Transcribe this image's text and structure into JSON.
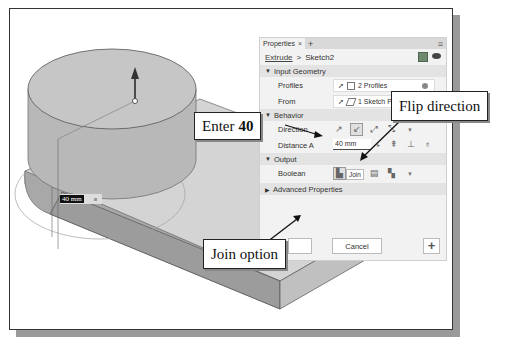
{
  "viewport": {
    "dimension_input": "40 mm"
  },
  "panel": {
    "tab_label": "Properties",
    "tab_close": "×",
    "tab_add": "+",
    "menu_icon": "≡",
    "breadcrumb": {
      "command": "Extrude",
      "separator": ">",
      "sketch": "Sketch2"
    },
    "sections": {
      "input_geometry": "Input Geometry",
      "behavior": "Behavior",
      "output": "Output",
      "advanced": "Advanced Properties"
    },
    "input_geometry": {
      "profiles_label": "Profiles",
      "profiles_value": "2 Profiles",
      "from_label": "From",
      "from_value": "1 Sketch Plane"
    },
    "behavior": {
      "direction_label": "Direction",
      "distance_label": "Distance A",
      "distance_value": "40 mm"
    },
    "output": {
      "boolean_label": "Boolean",
      "tooltip": "Join"
    },
    "buttons": {
      "cancel": "Cancel",
      "add": "+"
    }
  },
  "callouts": {
    "flip": "Flip direction",
    "enter_prefix": "Enter",
    "enter_value": "40",
    "join": "Join option"
  }
}
